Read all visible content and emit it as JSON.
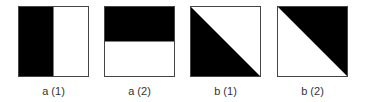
{
  "figure": {
    "panels": [
      {
        "id": "a1",
        "label": "a (1)",
        "pattern": "vertical-split",
        "black_region": "left-half"
      },
      {
        "id": "a2",
        "label": "a (2)",
        "pattern": "horizontal-split",
        "black_region": "top-half"
      },
      {
        "id": "b1",
        "label": "b (1)",
        "pattern": "diagonal-split",
        "black_region": "lower-left-triangle"
      },
      {
        "id": "b2",
        "label": "b (2)",
        "pattern": "diagonal-split",
        "black_region": "upper-right-triangle"
      }
    ],
    "colors": {
      "fill": "#000000",
      "background": "#ffffff",
      "border": "#444444",
      "label_text": "#333333"
    }
  }
}
